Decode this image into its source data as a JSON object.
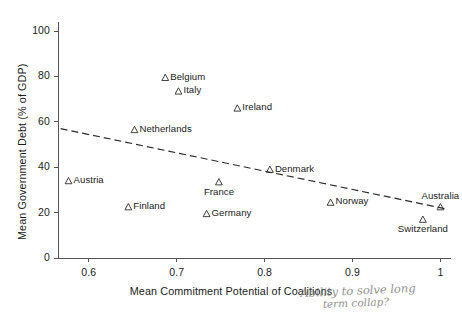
{
  "chart_data": {
    "type": "scatter",
    "title": "",
    "xlabel": "Mean Commitment Potential of Coalitions",
    "ylabel": "Mean Government Debt (% of GDP)",
    "xlim": [
      0.565,
      1.012
    ],
    "ylim": [
      0,
      104
    ],
    "xticks": [
      0.6,
      0.7,
      0.8,
      0.9,
      1
    ],
    "xtick_labels": [
      "0.6",
      "0.7",
      "0.8",
      "0.9",
      "1"
    ],
    "yticks": [
      0,
      20,
      40,
      60,
      80,
      100
    ],
    "ytick_labels": [
      "0",
      "20",
      "40",
      "60",
      "80",
      "100"
    ],
    "grid": false,
    "legend": "none",
    "marker": "open-triangle",
    "points": [
      {
        "label": "Belgium",
        "x": 0.687,
        "y": 79.5,
        "label_pos": "right"
      },
      {
        "label": "Italy",
        "x": 0.702,
        "y": 73.5,
        "label_pos": "right"
      },
      {
        "label": "Ireland",
        "x": 0.769,
        "y": 66.0,
        "label_pos": "right"
      },
      {
        "label": "Netherlands",
        "x": 0.652,
        "y": 56.5,
        "label_pos": "right"
      },
      {
        "label": "Austria",
        "x": 0.577,
        "y": 34.0,
        "label_pos": "right"
      },
      {
        "label": "France",
        "x": 0.748,
        "y": 33.5,
        "label_pos": "below"
      },
      {
        "label": "Denmark",
        "x": 0.806,
        "y": 39.0,
        "label_pos": "right"
      },
      {
        "label": "Finland",
        "x": 0.645,
        "y": 22.5,
        "label_pos": "right"
      },
      {
        "label": "Germany",
        "x": 0.734,
        "y": 19.5,
        "label_pos": "right"
      },
      {
        "label": "Norway",
        "x": 0.875,
        "y": 24.5,
        "label_pos": "right"
      },
      {
        "label": "Australia",
        "x": 1.0,
        "y": 22.5,
        "label_pos": "above"
      },
      {
        "label": "Switzerland",
        "x": 0.98,
        "y": 17.0,
        "label_pos": "below"
      }
    ],
    "trendline": {
      "style": "dashed",
      "x_start": 0.568,
      "y_start": 57.0,
      "x_end": 1.008,
      "y_end": 21.5
    }
  },
  "annotations": {
    "handwriting_line1": "Ability to solve long",
    "handwriting_line2": "term collap?"
  }
}
